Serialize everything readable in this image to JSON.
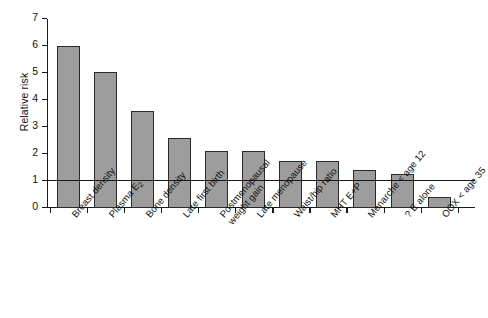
{
  "chart_data": {
    "type": "bar",
    "title": "",
    "xlabel": "",
    "ylabel": "Relative risk",
    "ylim": [
      0,
      7
    ],
    "yticks": [
      0,
      1,
      2,
      3,
      4,
      5,
      6,
      7
    ],
    "grid": false,
    "legend": "none",
    "reference_line": {
      "y": 1,
      "label": ""
    },
    "bar_color": "#9d9d9d",
    "bar_edge_color": "#2b2b2b",
    "categories": [
      "Breast density",
      "Plasma E2",
      "Bone density",
      "Late first birth",
      "Postmenopausal weight gain",
      "Late menopause",
      "Waist/hip ratio",
      "MHT E+P",
      "Menarche < age 12",
      "? E alone",
      "OOX < age 35"
    ],
    "values": [
      6.0,
      5.05,
      3.6,
      2.6,
      2.1,
      2.1,
      1.75,
      1.75,
      1.4,
      1.25,
      0.4
    ]
  },
  "axis": {
    "y_title": "Relative risk",
    "y_tick_labels": [
      "0",
      "1",
      "2",
      "3",
      "4",
      "5",
      "6",
      "7"
    ]
  },
  "categories": [
    {
      "line1": "Breast density",
      "line2": ""
    },
    {
      "line1": "Plasma E",
      "sub": "2",
      "line2": ""
    },
    {
      "line1": "Bone density",
      "line2": ""
    },
    {
      "line1": "Late first birth",
      "line2": ""
    },
    {
      "line1": "Postmenopausal",
      "line2": "weight gain"
    },
    {
      "line1": "Late menopause",
      "line2": ""
    },
    {
      "line1": "Waist/hip ratio",
      "line2": ""
    },
    {
      "line1": "MHT E+P",
      "line2": ""
    },
    {
      "line1": "Menarche < age 12",
      "line2": ""
    },
    {
      "line1": "? E alone",
      "line2": ""
    },
    {
      "line1": "OOX < age 35",
      "line2": ""
    }
  ]
}
